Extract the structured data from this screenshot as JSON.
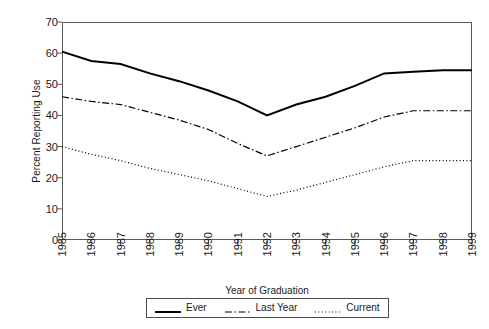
{
  "chart_data": {
    "type": "line",
    "title": "",
    "xlabel": "Year of Graduation",
    "ylabel": "Percent Reporting Use",
    "categories": [
      "1985",
      "1986",
      "1987",
      "1988",
      "1989",
      "1990",
      "1991",
      "1992",
      "1993",
      "1994",
      "1995",
      "1996",
      "1997",
      "1998",
      "1999"
    ],
    "ylim": [
      0,
      70
    ],
    "yticks": [
      0,
      10,
      20,
      30,
      40,
      50,
      60,
      70
    ],
    "grid": false,
    "legend_position": "bottom",
    "series": [
      {
        "name": "Ever",
        "style": "solid",
        "color": "#000000",
        "values": [
          60.5,
          57.5,
          56.5,
          53.5,
          51.0,
          48.0,
          44.5,
          40.0,
          43.5,
          46.0,
          49.5,
          53.5,
          54.0,
          54.5,
          54.5
        ]
      },
      {
        "name": "Last Year",
        "style": "dash-dot",
        "color": "#000000",
        "values": [
          46.0,
          44.5,
          43.5,
          41.0,
          38.5,
          35.5,
          31.0,
          27.0,
          30.0,
          33.0,
          36.0,
          39.5,
          41.5,
          41.5,
          41.5
        ]
      },
      {
        "name": "Current",
        "style": "dotted",
        "color": "#000000",
        "values": [
          30.0,
          27.5,
          25.5,
          23.0,
          21.0,
          19.0,
          16.5,
          14.0,
          16.0,
          18.5,
          21.0,
          23.5,
          25.5,
          25.5,
          25.5
        ]
      }
    ]
  },
  "axes": {
    "y_title": "Percent Reporting Use",
    "x_title": "Year of Graduation",
    "y_tick_labels": [
      "70",
      "60",
      "50",
      "40",
      "30",
      "20",
      "10",
      "0"
    ],
    "x_tick_labels": [
      "1985",
      "1986",
      "1987",
      "1988",
      "1989",
      "1990",
      "1991",
      "1992",
      "1993",
      "1994",
      "1995",
      "1996",
      "1997",
      "1998",
      "1999"
    ]
  },
  "legend": {
    "items": [
      {
        "label": "Ever"
      },
      {
        "label": "Last Year"
      },
      {
        "label": "Current"
      }
    ]
  },
  "colors": {
    "axis": "#5a5a5a",
    "line": "#000000",
    "text": "#1a1a1a",
    "background": "#ffffff"
  }
}
